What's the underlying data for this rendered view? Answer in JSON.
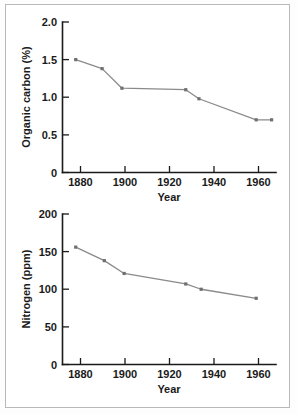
{
  "figure": {
    "background_color": "#ffffff",
    "frame_color": "#b9b9b9",
    "line_color": "#8a8a8a",
    "marker_color": "#6f6f6f",
    "axis_color": "#1a1a1a"
  },
  "chart_data": [
    {
      "type": "line",
      "title": "",
      "xlabel": "Year",
      "ylabel": "Organic carbon (%)",
      "xlim": [
        1870,
        1967
      ],
      "ylim": [
        0,
        2.0
      ],
      "xticks": [
        1880,
        1900,
        1920,
        1940,
        1960
      ],
      "xticklabels": [
        "1880",
        "1900",
        "1920",
        "1940",
        "1960"
      ],
      "yticks": [
        0,
        0.5,
        1.0,
        1.5,
        2.0
      ],
      "yticklabels": [
        "0",
        "0.5",
        "1.0",
        "1.5",
        "2.0"
      ],
      "grid": false,
      "legend": "none",
      "marker": "square",
      "x": [
        1876,
        1888,
        1897,
        1926,
        1932,
        1958,
        1965
      ],
      "values": [
        1.5,
        1.38,
        1.12,
        1.1,
        0.98,
        0.7,
        0.7
      ]
    },
    {
      "type": "line",
      "title": "",
      "xlabel": "Year",
      "ylabel": "Nitrogen (ppm)",
      "xlim": [
        1870,
        1967
      ],
      "ylim": [
        0,
        200
      ],
      "xticks": [
        1880,
        1900,
        1920,
        1940,
        1960
      ],
      "xticklabels": [
        "1880",
        "1900",
        "1920",
        "1940",
        "1960"
      ],
      "yticks": [
        0,
        50,
        100,
        150,
        200
      ],
      "yticklabels": [
        "0",
        "50",
        "100",
        "150",
        "200"
      ],
      "grid": false,
      "legend": "none",
      "marker": "square",
      "x": [
        1876,
        1889,
        1898,
        1926,
        1933,
        1958
      ],
      "values": [
        156,
        138,
        121,
        107,
        100,
        88
      ]
    }
  ]
}
